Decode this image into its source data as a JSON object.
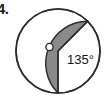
{
  "figure": {
    "problem_number": "4.",
    "background_color": "#ffffff",
    "outline_color": "#2b2b2b",
    "circle": {
      "center_marker": "o",
      "center_marker_label": "o",
      "center_x": 58,
      "center_y": 51,
      "radius": 42,
      "fill_unshaded_color": "#ffffff",
      "stroke_color": "#2b2b2b",
      "stroke_width": 1.6
    },
    "sector": {
      "angle_label": "135°",
      "angle_value": 135,
      "fill_color": "#8a8a8a",
      "stroke_color": "#2b2b2b",
      "start_angle_deg": 90,
      "end_angle_deg": 315,
      "label_x": 80,
      "label_y": 60
    },
    "radii": [
      {
        "name": "radius-down",
        "angle_deg": 90
      },
      {
        "name": "radius-up-right",
        "angle_deg": 315
      }
    ]
  }
}
